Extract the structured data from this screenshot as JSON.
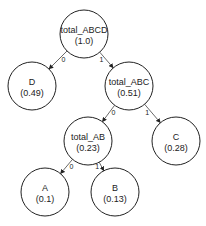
{
  "diagram": {
    "type": "binary-tree",
    "nodes": [
      {
        "id": "total_ABCD",
        "name": "total_ABCD",
        "value": "(1.0)",
        "cx": 84,
        "cy": 34,
        "rx": 24,
        "ry": 24
      },
      {
        "id": "D",
        "name": "D",
        "value": "(0.49)",
        "cx": 32,
        "cy": 86,
        "rx": 24,
        "ry": 24
      },
      {
        "id": "total_ABC",
        "name": "total_ABC",
        "value": "(0.51)",
        "cx": 129,
        "cy": 86,
        "rx": 24,
        "ry": 24
      },
      {
        "id": "total_AB",
        "name": "total_AB",
        "value": "(0.23)",
        "cx": 88,
        "cy": 141,
        "rx": 24,
        "ry": 24
      },
      {
        "id": "C",
        "name": "C",
        "value": "(0.28)",
        "cx": 176,
        "cy": 141,
        "rx": 24,
        "ry": 24
      },
      {
        "id": "A",
        "name": "A",
        "value": "(0.1)",
        "cx": 45,
        "cy": 192,
        "rx": 24,
        "ry": 24
      },
      {
        "id": "B",
        "name": "B",
        "value": "(0.13)",
        "cx": 115,
        "cy": 192,
        "rx": 24,
        "ry": 24
      }
    ],
    "edges": [
      {
        "from": "total_ABCD",
        "to": "D",
        "label": "0"
      },
      {
        "from": "total_ABCD",
        "to": "total_ABC",
        "label": "1"
      },
      {
        "from": "total_ABC",
        "to": "total_AB",
        "label": "0"
      },
      {
        "from": "total_ABC",
        "to": "C",
        "label": "1"
      },
      {
        "from": "total_AB",
        "to": "A",
        "label": "0"
      },
      {
        "from": "total_AB",
        "to": "B",
        "label": "1"
      }
    ]
  }
}
